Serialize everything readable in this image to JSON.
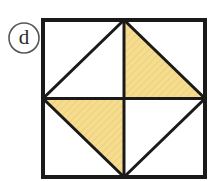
{
  "figure": {
    "label": "d",
    "label_shape": "circle",
    "canvas": {
      "width": 212,
      "height": 181,
      "background": "#ffffff"
    },
    "colors": {
      "stroke": "#1a1a1a",
      "shade_fill": "#f5dc8e",
      "shade_hatch": "#e8c96a",
      "label_stroke": "#555555",
      "label_text": "#2b2b2b",
      "background": "#ffffff"
    },
    "outer_square": {
      "name": "outer-square",
      "x": 43,
      "y": 20,
      "width": 162,
      "height": 157,
      "stroke_width": 4
    },
    "center_point": {
      "x": 124,
      "y": 98.5
    },
    "midpoints": {
      "top": {
        "x": 124,
        "y": 20
      },
      "right": {
        "x": 205,
        "y": 98.5
      },
      "bottom": {
        "x": 124,
        "y": 177
      },
      "left": {
        "x": 43,
        "y": 98.5
      }
    },
    "inscribed_diamond": {
      "name": "inscribed-diamond",
      "points": "124,20 205,98.5 124,177 43,98.5",
      "stroke_width": 3
    },
    "midlines": [
      {
        "name": "vertical-midline",
        "x1": 124,
        "y1": 20,
        "x2": 124,
        "y2": 177,
        "stroke_width": 3
      },
      {
        "name": "horizontal-midline",
        "x1": 43,
        "y1": 98.5,
        "x2": 205,
        "y2": 98.5,
        "stroke_width": 3
      }
    ],
    "shaded_triangles": [
      {
        "name": "shaded-triangle-top-right",
        "quadrant": "top-right",
        "points": "124,20 124,98.5 205,98.5",
        "fill": "#f5dc8e"
      },
      {
        "name": "shaded-triangle-bottom-left",
        "quadrant": "bottom-left",
        "points": "43,98.5 124,98.5 124,177",
        "fill": "#f5dc8e"
      }
    ],
    "label_badge": {
      "name": "figure-label-badge",
      "cx": 24,
      "cy": 38,
      "r": 15,
      "stroke_width": 1.6,
      "text_x": 24,
      "text_y": 39
    }
  }
}
